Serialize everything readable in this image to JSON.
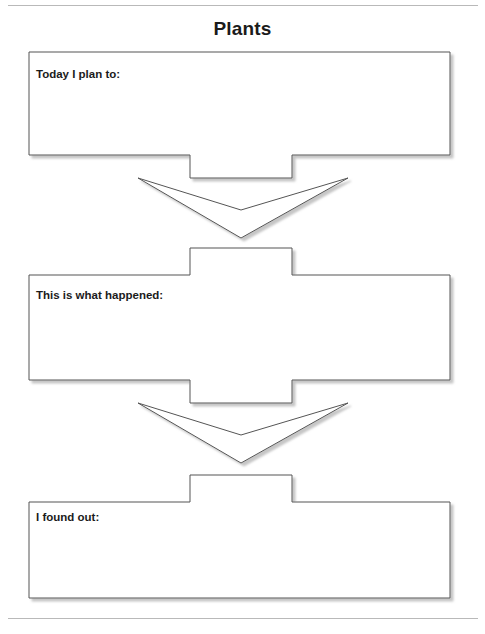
{
  "page": {
    "title": "Plants",
    "title_color": "#1b1b1b",
    "background_color": "#ffffff",
    "rule_color": "#b9b9b9",
    "has_top_rule": true,
    "has_bottom_rule": true
  },
  "diagram": {
    "type": "vertical-flowchart",
    "shape_outline_color": "#555555",
    "shape_fill_color": "#ffffff",
    "shadow_color": "#9a9a9a",
    "arrow_count": 2,
    "arrow_direction": "down",
    "boxes": [
      {
        "id": "plan",
        "label": "Today I plan to:",
        "notch": "bottom"
      },
      {
        "id": "happened",
        "label": "This is what happened:",
        "notch": "both"
      },
      {
        "id": "found",
        "label": "I found out:",
        "notch": "top"
      }
    ]
  }
}
